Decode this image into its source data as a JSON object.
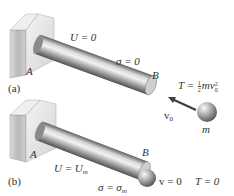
{
  "figure": {
    "panel_a": {
      "label": "(a)",
      "support_label": "A",
      "end_label": "B",
      "energy_label": "U = 0",
      "stress_label": "σ = 0",
      "kinetic_energy": {
        "prefix": "T = ",
        "frac_num": "1",
        "frac_den": "2",
        "suffix_m": "mv",
        "suffix_sub": "0",
        "suffix_sup": "2"
      },
      "velocity_label": "v",
      "velocity_sub": "0",
      "mass_label": "m"
    },
    "panel_b": {
      "label": "(b)",
      "support_label": "A",
      "end_label": "B",
      "energy_prefix": "U = U",
      "energy_sub": "m",
      "stress_prefix": "σ = σ",
      "stress_sub": "m",
      "velocity_label": "v = 0",
      "kinetic_label": "T = 0"
    },
    "colors": {
      "block_front": "#c8c8c8",
      "block_side": "#e6e6e6",
      "rod_dark": "#6a6a6a",
      "rod_light": "#e8e8e8",
      "arrow": "#4a4a4a",
      "text": "#333333"
    }
  }
}
